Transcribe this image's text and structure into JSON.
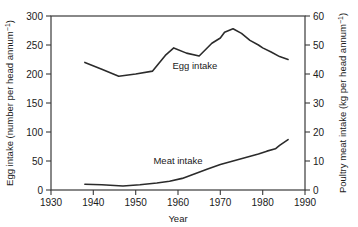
{
  "chart_data": {
    "type": "line",
    "title": "",
    "xlabel": "Year",
    "ylabel": "Egg intake (number per head annum",
    "ylabel_sup": "−1",
    "ylabel_tail": ")",
    "y2label": "Poultry meat intake (kg per head annum",
    "y2label_sup": "−1",
    "y2label_tail": ")",
    "xlim": [
      1930,
      1990
    ],
    "ylim": [
      0,
      300
    ],
    "y2lim": [
      0,
      60
    ],
    "grid": false,
    "legend_position": "inline-annotations",
    "xticks": [
      1930,
      1940,
      1950,
      1960,
      1970,
      1980,
      1990
    ],
    "xticklabels": [
      "1930",
      "1940",
      "1950",
      "1960",
      "1970",
      "1980",
      "1990"
    ],
    "yticks": [
      0,
      50,
      100,
      150,
      200,
      250,
      300
    ],
    "yticklabels": [
      "0",
      "50",
      "100",
      "150",
      "200",
      "250",
      "300"
    ],
    "y2ticks": [
      0,
      10,
      20,
      30,
      40,
      50,
      60
    ],
    "y2ticklabels": [
      "0",
      "10",
      "20",
      "30",
      "40",
      "50",
      "60"
    ],
    "series": [
      {
        "name": "Egg intake",
        "axis": "left",
        "units": "number per head annum-1",
        "x": [
          1938,
          1942,
          1946,
          1950,
          1954,
          1957,
          1959,
          1962,
          1965,
          1968,
          1970,
          1971,
          1973,
          1975,
          1977,
          1979,
          1980,
          1982,
          1984,
          1986
        ],
        "values": [
          220,
          208,
          196,
          200,
          205,
          232,
          245,
          236,
          231,
          253,
          262,
          272,
          278,
          270,
          258,
          250,
          245,
          238,
          230,
          225
        ]
      },
      {
        "name": "Meat intake",
        "axis": "right",
        "units": "kg per head annum-1",
        "x": [
          1938,
          1942,
          1947,
          1951,
          1955,
          1958,
          1961,
          1964,
          1967,
          1970,
          1973,
          1976,
          1979,
          1981,
          1983,
          1984,
          1986
        ],
        "values": [
          2.0,
          1.8,
          1.4,
          1.8,
          2.4,
          3.0,
          4.0,
          5.6,
          7.2,
          8.8,
          10.0,
          11.2,
          12.4,
          13.4,
          14.2,
          15.4,
          17.4
        ]
      }
    ],
    "annotations": [
      {
        "text": "Egg intake",
        "x": 1964,
        "y": 208,
        "axis": "left"
      },
      {
        "text": "Meat intake",
        "x": 1960,
        "y": 45,
        "axis": "left"
      }
    ]
  }
}
